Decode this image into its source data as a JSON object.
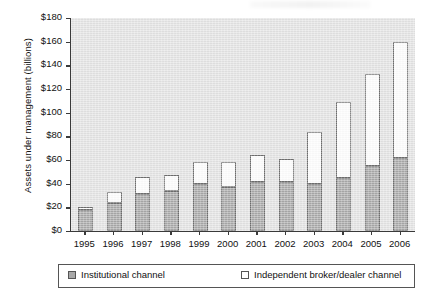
{
  "chart_data": {
    "type": "bar",
    "title": "",
    "xlabel": "",
    "ylabel": "Assets under management (billions)",
    "stacked": true,
    "grid": false,
    "legend_position": "bottom",
    "ylim": [
      0,
      180
    ],
    "ytick_step": 20,
    "ytick_labels": [
      "$0",
      "$20",
      "$40",
      "$60",
      "$80",
      "$100",
      "$120",
      "$140",
      "$160",
      "$180"
    ],
    "ytick_values": [
      0,
      20,
      40,
      60,
      80,
      100,
      120,
      140,
      160,
      180
    ],
    "categories": [
      "1995",
      "1996",
      "1997",
      "1998",
      "1999",
      "2000",
      "2001",
      "2002",
      "2003",
      "2004",
      "2005",
      "2006"
    ],
    "series": [
      {
        "name": "Institutional channel",
        "color": "#a8a8a8",
        "values": [
          18,
          24,
          31,
          34,
          40,
          37,
          41,
          41,
          40,
          45,
          55,
          62
        ]
      },
      {
        "name": "Independent broker/dealer channel",
        "color": "#ffffff",
        "values": [
          2,
          9,
          15,
          13,
          18,
          21,
          23,
          20,
          44,
          64,
          78,
          98
        ]
      }
    ],
    "totals": [
      20,
      33,
      46,
      47,
      58,
      58,
      64,
      61,
      84,
      109,
      133,
      160
    ]
  },
  "legend": {
    "items": [
      {
        "label": "Institutional channel",
        "swatch": "filled-gray-swatch"
      },
      {
        "label": "Independent broker/dealer channel",
        "swatch": "open-white-swatch"
      }
    ]
  },
  "colors": {
    "plot_background": "#e3e3e3",
    "axis": "#3a3a3a",
    "institutional": "#a8a8a8",
    "independent": "#ffffff",
    "bar_stroke": "#6d6d6d",
    "page_background": "#ffffff"
  }
}
